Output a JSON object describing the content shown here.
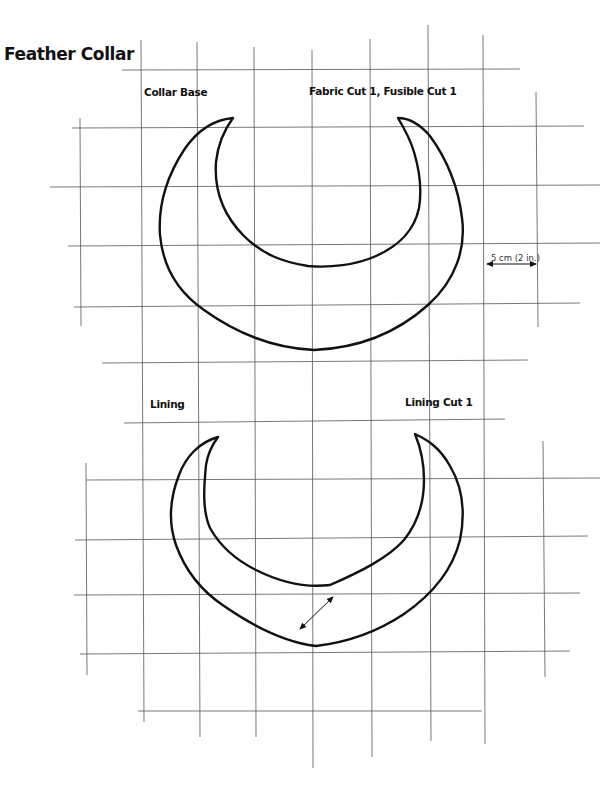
{
  "title": "Feather Collar",
  "pieces": [
    {
      "name": "Collar Base",
      "cut_instructions": "Fabric Cut 1, Fusible Cut 1"
    },
    {
      "name": "Lining",
      "cut_instructions": "Lining Cut 1"
    }
  ],
  "scale": {
    "label": "5 cm (2 in.)",
    "grid_square_cm": 5,
    "grid_square_in": 2
  },
  "grain_line_icon": "double-arrow-icon",
  "colors": {
    "outline": "#111111",
    "grid": "#555555",
    "background": "#ffffff"
  }
}
